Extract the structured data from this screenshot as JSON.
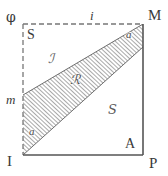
{
  "figure": {
    "type": "geometric-diagram",
    "colors": {
      "stroke": "#555555",
      "dashed_stroke": "#777777",
      "hatch": "#8a8a8a",
      "label": "#3a3a3a",
      "background": "#ffffff"
    },
    "square": {
      "left": 23,
      "top": 24,
      "right": 143,
      "bottom": 155,
      "top_edge_style": "dashed",
      "left_edge_style": "dashed",
      "right_edge_style": "solid",
      "bottom_edge_style": "solid"
    },
    "band": {
      "style": "diagonal-hatched",
      "direction": "lower-left-to-upper-right"
    }
  },
  "labels": {
    "outer": {
      "top_left": "φ",
      "top_right": "M",
      "bottom_left": "I",
      "bottom_right": "P"
    },
    "inner": {
      "top_left": "S",
      "bottom_right": "A"
    },
    "edges": {
      "top": "i",
      "left": "m"
    },
    "angles": {
      "top_right": "a",
      "bottom_left": "a"
    },
    "regions": {
      "upper_left": "ℐ",
      "band_center": "ℛ",
      "lower_right": "𝑆"
    }
  }
}
